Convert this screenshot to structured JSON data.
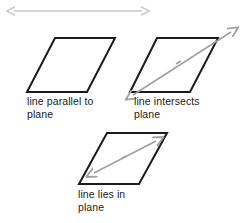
{
  "figure": {
    "background_color": "#ffffff",
    "outline_color": "#1b1b1b",
    "arrow_color_light": "#c9c9c9",
    "arrow_color_mid": "#a0a0a0",
    "text_color": "#1b1b1b"
  },
  "top_arrow": {
    "name": "standalone line",
    "kind": "double-headed-arrow",
    "x1": 9,
    "y1": 11,
    "x2": 147,
    "y2": 11,
    "color": "#c9c9c9"
  },
  "panels": [
    {
      "id": "parallel",
      "caption": "line parallel to\nplane",
      "plane": {
        "points": "55,38 115,38 87,92 27,92",
        "stroke": "#1b1b1b",
        "stroke_width": 2
      },
      "line": null
    },
    {
      "id": "intersects",
      "caption": "line intersects\nplane",
      "plane": {
        "points": "157,38 218,38 190,92 130,92",
        "stroke": "#1b1b1b",
        "stroke_width": 2
      },
      "line": {
        "kind": "double-headed-arrow",
        "x1": 129,
        "y1": 98,
        "x2": 235,
        "y2": 28,
        "color": "#a0a0a0",
        "relation": "passes through the plane"
      }
    },
    {
      "id": "lies-in",
      "caption": "line lies in\nplane",
      "plane": {
        "points": "107,133 167,133 139,184 79,184",
        "stroke": "#1b1b1b",
        "stroke_width": 2
      },
      "line": {
        "kind": "double-headed-arrow",
        "x1": 90,
        "y1": 176,
        "x2": 160,
        "y2": 139,
        "color": "#a0a0a0",
        "relation": "contained within the plane"
      }
    }
  ],
  "captions": {
    "parallel": "line parallel to\nplane",
    "intersects": "line intersects\nplane",
    "lies_in": "line lies in\nplane"
  }
}
